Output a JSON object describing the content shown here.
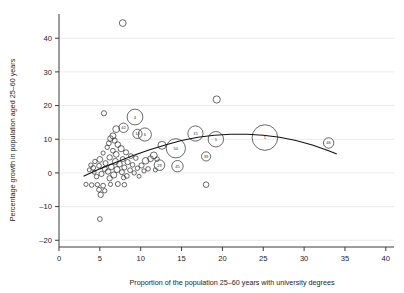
{
  "chart_data": {
    "type": "scatter",
    "title": "",
    "subtitle": "",
    "xlabel": "Proportion of the population 25–60 years with university degrees",
    "ylabel": "Percentage growth in population aged 25–60 years",
    "xlim": [
      0,
      41
    ],
    "ylim": [
      -22,
      46
    ],
    "xticks": [
      0,
      5,
      10,
      15,
      20,
      25,
      30,
      35,
      40
    ],
    "xticklabels": [
      "0",
      "5",
      "10",
      "15",
      "20",
      "25",
      "30",
      "35",
      "40"
    ],
    "yticks": [
      -20,
      -10,
      0,
      10,
      20,
      30,
      40
    ],
    "yticklabels": [
      "–20",
      "–10",
      "0",
      "10",
      "20",
      "30",
      "40"
    ],
    "grid": "horizontal",
    "legend": "none",
    "marker": "open-circle",
    "size_encodes": "bubble area",
    "points": [
      {
        "label": "",
        "x": 7.8,
        "y": 44.5,
        "r": 3.4
      },
      {
        "label": "",
        "x": 19.3,
        "y": 21.8,
        "r": 3.6
      },
      {
        "label": "",
        "x": 5.5,
        "y": 17.7,
        "r": 2.6
      },
      {
        "label": "4",
        "x": 9.3,
        "y": 16.6,
        "r": 7.9
      },
      {
        "label": "42",
        "x": 7.9,
        "y": 13.4,
        "r": 4.7
      },
      {
        "label": "",
        "x": 7.0,
        "y": 13.0,
        "r": 3.4
      },
      {
        "label": "13",
        "x": 9.6,
        "y": 11.6,
        "r": 4.6
      },
      {
        "label": "6",
        "x": 10.5,
        "y": 11.4,
        "r": 6.6
      },
      {
        "label": "15",
        "x": 16.7,
        "y": 11.7,
        "r": 7.6
      },
      {
        "label": "5",
        "x": 19.2,
        "y": 10.0,
        "r": 7.7
      },
      {
        "label": "1",
        "x": 25.2,
        "y": 10.5,
        "r": 12.8
      },
      {
        "label": "46",
        "x": 33.0,
        "y": 8.9,
        "r": 5.2
      },
      {
        "label": "50",
        "x": 14.3,
        "y": 7.3,
        "r": 9.6
      },
      {
        "label": "39",
        "x": 18.0,
        "y": 4.9,
        "r": 4.6
      },
      {
        "label": "45",
        "x": 14.5,
        "y": 2.0,
        "r": 5.7
      },
      {
        "label": "29",
        "x": 12.3,
        "y": 2.3,
        "r": 5.3
      },
      {
        "label": "",
        "x": 12.6,
        "y": 8.2,
        "r": 4.0
      },
      {
        "label": "",
        "x": 11.6,
        "y": 5.2,
        "r": 3.4
      },
      {
        "label": "",
        "x": 11.2,
        "y": 4.2,
        "r": 2.9
      },
      {
        "label": "",
        "x": 10.6,
        "y": 3.6,
        "r": 3.3
      },
      {
        "label": "",
        "x": 12.0,
        "y": 4.1,
        "r": 2.3
      },
      {
        "label": "",
        "x": 6.6,
        "y": 11.0,
        "r": 3.0
      },
      {
        "label": "",
        "x": 6.3,
        "y": 10.2,
        "r": 2.8
      },
      {
        "label": "",
        "x": 6.8,
        "y": 9.6,
        "r": 2.6
      },
      {
        "label": "",
        "x": 6.1,
        "y": 8.8,
        "r": 2.4
      },
      {
        "label": "",
        "x": 7.2,
        "y": 8.4,
        "r": 2.8
      },
      {
        "label": "",
        "x": 5.9,
        "y": 7.6,
        "r": 2.2
      },
      {
        "label": "",
        "x": 7.6,
        "y": 7.2,
        "r": 3.1
      },
      {
        "label": "",
        "x": 6.6,
        "y": 6.6,
        "r": 2.4
      },
      {
        "label": "",
        "x": 8.2,
        "y": 6.1,
        "r": 2.6
      },
      {
        "label": "",
        "x": 7.0,
        "y": 5.5,
        "r": 2.9
      },
      {
        "label": "",
        "x": 5.4,
        "y": 5.9,
        "r": 2.1
      },
      {
        "label": "",
        "x": 8.8,
        "y": 5.0,
        "r": 2.4
      },
      {
        "label": "",
        "x": 6.2,
        "y": 4.6,
        "r": 2.7
      },
      {
        "label": "",
        "x": 7.8,
        "y": 4.1,
        "r": 2.5
      },
      {
        "label": "",
        "x": 9.4,
        "y": 4.4,
        "r": 2.3
      },
      {
        "label": "",
        "x": 5.0,
        "y": 4.0,
        "r": 2.9
      },
      {
        "label": "",
        "x": 6.9,
        "y": 3.4,
        "r": 3.0
      },
      {
        "label": "",
        "x": 8.4,
        "y": 3.2,
        "r": 2.6
      },
      {
        "label": "",
        "x": 4.4,
        "y": 3.4,
        "r": 2.2
      },
      {
        "label": "",
        "x": 5.7,
        "y": 2.9,
        "r": 2.5
      },
      {
        "label": "",
        "x": 7.4,
        "y": 2.6,
        "r": 2.8
      },
      {
        "label": "",
        "x": 9.0,
        "y": 2.4,
        "r": 2.3
      },
      {
        "label": "",
        "x": 10.1,
        "y": 2.2,
        "r": 2.6
      },
      {
        "label": "",
        "x": 4.9,
        "y": 2.1,
        "r": 2.4
      },
      {
        "label": "",
        "x": 6.4,
        "y": 1.8,
        "r": 2.9
      },
      {
        "label": "",
        "x": 8.0,
        "y": 1.6,
        "r": 2.5
      },
      {
        "label": "",
        "x": 9.6,
        "y": 1.4,
        "r": 2.2
      },
      {
        "label": "",
        "x": 5.6,
        "y": 1.2,
        "r": 2.6
      },
      {
        "label": "",
        "x": 7.1,
        "y": 1.0,
        "r": 3.0
      },
      {
        "label": "",
        "x": 8.7,
        "y": 0.8,
        "r": 2.4
      },
      {
        "label": "",
        "x": 10.4,
        "y": 0.6,
        "r": 2.1
      },
      {
        "label": "",
        "x": 4.2,
        "y": 1.5,
        "r": 2.3
      },
      {
        "label": "",
        "x": 6.0,
        "y": 0.4,
        "r": 2.7
      },
      {
        "label": "",
        "x": 7.7,
        "y": 0.2,
        "r": 2.5
      },
      {
        "label": "",
        "x": 9.2,
        "y": 0.0,
        "r": 2.2
      },
      {
        "label": "",
        "x": 5.2,
        "y": -0.3,
        "r": 2.6
      },
      {
        "label": "",
        "x": 6.7,
        "y": -0.6,
        "r": 3.1
      },
      {
        "label": "",
        "x": 8.3,
        "y": -0.9,
        "r": 2.4
      },
      {
        "label": "",
        "x": 3.7,
        "y": 0.9,
        "r": 2.0
      },
      {
        "label": "",
        "x": 4.6,
        "y": -1.1,
        "r": 2.3
      },
      {
        "label": "",
        "x": 6.2,
        "y": -1.6,
        "r": 2.7
      },
      {
        "label": "",
        "x": 7.9,
        "y": -1.4,
        "r": 2.2
      },
      {
        "label": "",
        "x": 9.8,
        "y": -1.0,
        "r": 2.0
      },
      {
        "label": "",
        "x": 3.3,
        "y": -3.4,
        "r": 2.1
      },
      {
        "label": "",
        "x": 4.0,
        "y": -3.6,
        "r": 2.3
      },
      {
        "label": "",
        "x": 4.7,
        "y": -3.5,
        "r": 2.2
      },
      {
        "label": "",
        "x": 5.4,
        "y": -3.8,
        "r": 2.4
      },
      {
        "label": "",
        "x": 6.3,
        "y": -3.4,
        "r": 2.1
      },
      {
        "label": "",
        "x": 7.2,
        "y": -3.3,
        "r": 2.5
      },
      {
        "label": "",
        "x": 8.0,
        "y": -3.5,
        "r": 2.3
      },
      {
        "label": "",
        "x": 4.9,
        "y": -5.0,
        "r": 2.4
      },
      {
        "label": "",
        "x": 5.6,
        "y": -5.3,
        "r": 2.2
      },
      {
        "label": "",
        "x": 5.1,
        "y": -6.5,
        "r": 2.7
      },
      {
        "label": "",
        "x": 5.0,
        "y": -13.7,
        "r": 2.4
      },
      {
        "label": "",
        "x": 18.0,
        "y": -3.5,
        "r": 2.8
      },
      {
        "label": "",
        "x": 3.9,
        "y": 2.3,
        "r": 2.2
      },
      {
        "label": "",
        "x": 4.3,
        "y": 0.2,
        "r": 2.0
      },
      {
        "label": "",
        "x": 10.9,
        "y": 1.2,
        "r": 2.3
      },
      {
        "label": "",
        "x": 11.8,
        "y": 0.9,
        "r": 2.1
      }
    ],
    "fit_curve": {
      "name": "fitted quadratic trend",
      "x": [
        3.0,
        5.0,
        7.0,
        9.0,
        11.0,
        13.0,
        15.0,
        17.0,
        19.0,
        21.0,
        23.0,
        25.0,
        27.0,
        29.0,
        31.0,
        33.0,
        34.0
      ],
      "y": [
        -1.0,
        1.2,
        3.2,
        5.1,
        6.8,
        8.3,
        9.6,
        10.6,
        11.2,
        11.5,
        11.5,
        11.2,
        10.6,
        9.6,
        8.3,
        6.6,
        5.6
      ]
    }
  },
  "style": {
    "axis_color": "#3a3a3a",
    "grid_color": "#e4e4e4",
    "bubble_stroke": "#2b2b2b",
    "curve_color": "#111111",
    "background": "#ffffff"
  }
}
